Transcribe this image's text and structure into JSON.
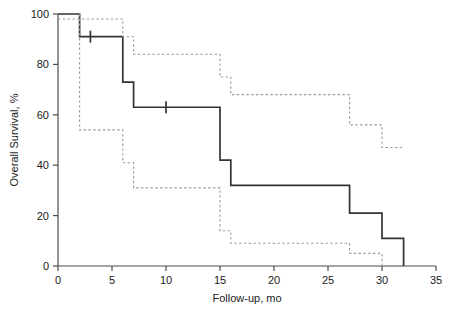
{
  "chart_data": {
    "type": "line",
    "title": "",
    "subtitle": "",
    "xlabel": "Follow-up, mo",
    "ylabel": "Overall Survival, %",
    "xlim": [
      0,
      35
    ],
    "ylim": [
      0,
      100
    ],
    "xticks": [
      0,
      5,
      10,
      15,
      20,
      25,
      30,
      35
    ],
    "yticks": [
      0,
      20,
      40,
      60,
      80,
      100
    ],
    "xtick_labels": [
      "0",
      "5",
      "10",
      "15",
      "20",
      "25",
      "30",
      "35"
    ],
    "ytick_labels": [
      "0",
      "20",
      "40",
      "60",
      "80",
      "100"
    ],
    "grid": false,
    "legend": null,
    "legend_position": "none",
    "series": [
      {
        "name": "Overall survival (Kaplan-Meier estimate)",
        "style": "solid",
        "color": "#333333",
        "step": "post",
        "points": [
          {
            "x": 0,
            "y": 100
          },
          {
            "x": 2,
            "y": 100
          },
          {
            "x": 2,
            "y": 91
          },
          {
            "x": 6,
            "y": 91
          },
          {
            "x": 6,
            "y": 73
          },
          {
            "x": 7,
            "y": 73
          },
          {
            "x": 7,
            "y": 63
          },
          {
            "x": 15,
            "y": 63
          },
          {
            "x": 15,
            "y": 42
          },
          {
            "x": 16,
            "y": 42
          },
          {
            "x": 16,
            "y": 32
          },
          {
            "x": 27,
            "y": 32
          },
          {
            "x": 27,
            "y": 21
          },
          {
            "x": 30,
            "y": 21
          },
          {
            "x": 30,
            "y": 11
          },
          {
            "x": 32,
            "y": 11
          },
          {
            "x": 32,
            "y": 0
          }
        ],
        "censored": [
          {
            "x": 3,
            "y": 91
          },
          {
            "x": 10,
            "y": 63
          }
        ]
      },
      {
        "name": "Upper 95% confidence limit",
        "style": "dashed",
        "color": "#9a9a9a",
        "step": "post",
        "points": [
          {
            "x": 0,
            "y": 98
          },
          {
            "x": 2,
            "y": 98
          },
          {
            "x": 6,
            "y": 98
          },
          {
            "x": 6,
            "y": 91
          },
          {
            "x": 7,
            "y": 91
          },
          {
            "x": 7,
            "y": 84
          },
          {
            "x": 15,
            "y": 84
          },
          {
            "x": 15,
            "y": 75
          },
          {
            "x": 16,
            "y": 75
          },
          {
            "x": 16,
            "y": 68
          },
          {
            "x": 27,
            "y": 68
          },
          {
            "x": 27,
            "y": 56
          },
          {
            "x": 30,
            "y": 56
          },
          {
            "x": 30,
            "y": 47
          },
          {
            "x": 32,
            "y": 47
          }
        ]
      },
      {
        "name": "Lower 95% confidence limit",
        "style": "dashed",
        "color": "#9a9a9a",
        "step": "post",
        "points": [
          {
            "x": 2,
            "y": 100
          },
          {
            "x": 2,
            "y": 54
          },
          {
            "x": 6,
            "y": 54
          },
          {
            "x": 6,
            "y": 41
          },
          {
            "x": 7,
            "y": 41
          },
          {
            "x": 7,
            "y": 31
          },
          {
            "x": 15,
            "y": 31
          },
          {
            "x": 15,
            "y": 14
          },
          {
            "x": 16,
            "y": 14
          },
          {
            "x": 16,
            "y": 9
          },
          {
            "x": 27,
            "y": 9
          },
          {
            "x": 27,
            "y": 5
          },
          {
            "x": 30,
            "y": 5
          },
          {
            "x": 30,
            "y": 0
          },
          {
            "x": 32,
            "y": 0
          }
        ]
      }
    ]
  },
  "axes": {
    "x_title": "Follow-up, mo",
    "y_title": "Overall Survival, %"
  }
}
